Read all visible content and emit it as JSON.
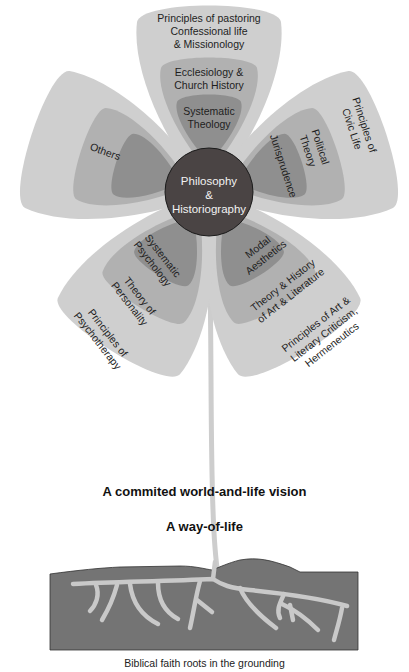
{
  "colors": {
    "outer_layer": "#cfcfcf",
    "middle_layer": "#b1b1b1",
    "inner_layer": "#8f8f8f",
    "center": "#4a4444",
    "stem": "#cdcdcd",
    "ground": "#747474",
    "roots": "#c9c9c9"
  },
  "center": {
    "line1": "Philosophy",
    "line2": "&",
    "line3": "Historiography"
  },
  "petals": [
    {
      "name": "theology",
      "outer": [
        "Principles of pastoring",
        "Confessional life",
        "& Missionology"
      ],
      "middle": [
        "Ecclesiology &",
        "Church History"
      ],
      "inner": [
        "Systematic",
        "Theology"
      ]
    },
    {
      "name": "civic",
      "outer": [
        "Principles of",
        "Civic Life"
      ],
      "middle": [
        "Political",
        "Theory"
      ],
      "inner": [
        "Jurisprudence"
      ]
    },
    {
      "name": "art",
      "outer": [
        "Principles of Art &",
        "Literary Criticism,",
        "Hermeneutics"
      ],
      "middle": [
        "Theory & History",
        "of Art & Literature"
      ],
      "inner": [
        "Modal",
        "Aesthetics"
      ]
    },
    {
      "name": "psychology",
      "outer": [
        "Principles of",
        "Psychotherapy"
      ],
      "middle": [
        "Theory of",
        "Personality"
      ],
      "inner": [
        "Systematic",
        "Psychology"
      ]
    },
    {
      "name": "others",
      "outer": [],
      "middle": [
        "Others"
      ],
      "inner": []
    }
  ],
  "vision_text": "A commited world-and-life vision",
  "way_of_life_text": "A way-of-life",
  "roots_caption": "Biblical faith roots in the grounding"
}
